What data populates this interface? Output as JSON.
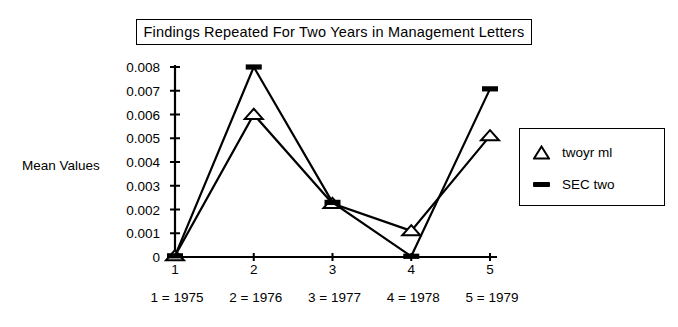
{
  "chart_data": {
    "type": "line",
    "title": "Findings Repeated For Two Years in Management Letters",
    "xlabel": "",
    "ylabel": "Mean Values",
    "x": [
      1,
      2,
      3,
      4,
      5
    ],
    "xtick_labels": [
      "1",
      "2",
      "3",
      "4",
      "5"
    ],
    "ytick_labels": [
      "0.008",
      "0.007",
      "0.006",
      "0.005",
      "0.004",
      "0.003",
      "0.002",
      "0.001",
      "0"
    ],
    "ytick_values": [
      0.008,
      0.007,
      0.006,
      0.005,
      0.004,
      0.003,
      0.002,
      0.001,
      0
    ],
    "ylim": [
      0,
      0.008
    ],
    "xlim": [
      1,
      5
    ],
    "grid": false,
    "legend_position": "right",
    "series": [
      {
        "name": "twoyr ml",
        "marker": "open-triangle",
        "values": [
          5e-05,
          0.006,
          0.00225,
          0.0011,
          0.0051
        ]
      },
      {
        "name": "SEC two",
        "marker": "thick-dash",
        "values": [
          5e-05,
          0.008,
          0.0023,
          3e-05,
          0.00708
        ]
      }
    ],
    "x_key": [
      "1 = 1975",
      "2 = 1976",
      "3 = 1977",
      "4 = 1978",
      "5 = 1979"
    ]
  },
  "legend": {
    "items": [
      {
        "label": "twoyr ml",
        "marker": "open-triangle"
      },
      {
        "label": "SEC two",
        "marker": "thick-dash"
      }
    ]
  }
}
